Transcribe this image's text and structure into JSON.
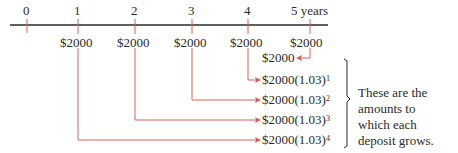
{
  "timeline": {
    "labels": [
      "0",
      "1",
      "2",
      "3",
      "4",
      "5 years"
    ],
    "deposits": [
      "$2000",
      "$2000",
      "$2000",
      "$2000",
      "$2000"
    ]
  },
  "amounts": [
    {
      "base": "$2000",
      "factor": "",
      "exponent": ""
    },
    {
      "base": "$2000",
      "factor": "(1.03)",
      "exponent": "1"
    },
    {
      "base": "$2000",
      "factor": "(1.03)",
      "exponent": "2"
    },
    {
      "base": "$2000",
      "factor": "(1.03)",
      "exponent": "3"
    },
    {
      "base": "$2000",
      "factor": "(1.03)",
      "exponent": "4"
    }
  ],
  "note": {
    "lines": [
      "These are the",
      "amounts to",
      "which each",
      "deposit grows."
    ]
  },
  "colors": {
    "arrow": "#d9605a",
    "axis": "#2a2a2a",
    "text": "#2a2a2a"
  }
}
